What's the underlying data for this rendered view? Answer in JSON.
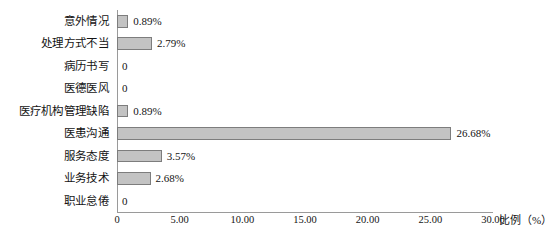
{
  "chart_data": {
    "type": "bar",
    "orientation": "horizontal",
    "title": "",
    "xlabel": "比例（%）",
    "ylabel": "",
    "xlim": [
      0,
      30
    ],
    "grid": false,
    "legend": null,
    "categories": [
      "意外情况",
      "处理方式不当",
      "病历书写",
      "医德医风",
      "医疗机构管理缺陷",
      "医患沟通",
      "服务态度",
      "业务技术",
      "职业怠倦"
    ],
    "values": [
      0.89,
      2.79,
      0,
      0,
      0.89,
      26.68,
      3.57,
      2.68,
      0
    ],
    "value_labels": [
      "0.89%",
      "2.79%",
      "0",
      "0",
      "0.89%",
      "26.68%",
      "3.57%",
      "2.68%",
      "0"
    ],
    "xticks": [
      0,
      5,
      10,
      15,
      20,
      25,
      30
    ],
    "xtick_labels": [
      "0",
      "5.00",
      "10.00",
      "15.00",
      "20.00",
      "25.00",
      "30.00"
    ],
    "colors": {
      "bar_fill": "#c3c3c3",
      "bar_border": "#7d7d7d",
      "axis": "#9a9a9a",
      "text": "#141414",
      "background": "#ffffff"
    }
  }
}
